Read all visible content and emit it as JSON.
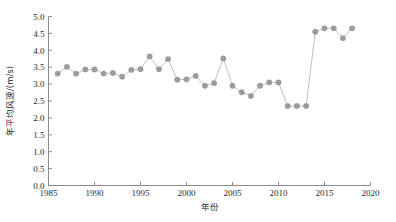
{
  "chart_data": {
    "type": "line",
    "title": "",
    "xlabel": "年份",
    "ylabel": "年平均风速/(m/s)",
    "xlim": [
      1985,
      2020
    ],
    "ylim": [
      0.0,
      5.0
    ],
    "xticks": [
      1985,
      1990,
      1995,
      2000,
      2005,
      2010,
      2015,
      2020
    ],
    "xtick_labels": [
      "1985",
      "1990",
      "1995",
      "2000",
      "2005",
      "2010",
      "2015",
      "2020"
    ],
    "yticks": [
      0.0,
      0.5,
      1.0,
      1.5,
      2.0,
      2.5,
      3.0,
      3.5,
      4.0,
      4.5,
      5.0
    ],
    "ytick_labels": [
      "0.0",
      "0.5",
      "1.0",
      "1.5",
      "2.0",
      "2.5",
      "3.0",
      "3.5",
      "4.0",
      "4.5",
      "5.0"
    ],
    "grid": false,
    "legend": false,
    "legend_position": "none",
    "marker": "circle",
    "marker_color": "#9c9c9c",
    "line_color": "#b0b0b0",
    "x": [
      1986,
      1987,
      1988,
      1989,
      1990,
      1991,
      1992,
      1993,
      1994,
      1995,
      1996,
      1997,
      1998,
      1999,
      2000,
      2001,
      2002,
      2003,
      2004,
      2005,
      2006,
      2007,
      2008,
      2009,
      2010,
      2011,
      2012,
      2013,
      2014,
      2015,
      2016,
      2017,
      2018
    ],
    "values": [
      3.31,
      3.51,
      3.31,
      3.43,
      3.43,
      3.31,
      3.33,
      3.22,
      3.42,
      3.44,
      3.82,
      3.44,
      3.74,
      3.13,
      3.14,
      3.24,
      2.95,
      3.03,
      3.76,
      2.95,
      2.76,
      2.65,
      2.95,
      3.05,
      3.05,
      2.35,
      2.35,
      2.35,
      4.55,
      4.65,
      4.65,
      4.36,
      4.65
    ],
    "series": [
      {
        "name": "年平均风速",
        "values": [
          3.31,
          3.51,
          3.31,
          3.43,
          3.43,
          3.31,
          3.33,
          3.22,
          3.42,
          3.44,
          3.82,
          3.44,
          3.74,
          3.13,
          3.14,
          3.24,
          2.95,
          3.03,
          3.76,
          2.95,
          2.76,
          2.65,
          2.95,
          3.05,
          3.05,
          2.35,
          2.35,
          2.35,
          4.55,
          4.65,
          4.65,
          4.36,
          4.65
        ]
      }
    ]
  }
}
